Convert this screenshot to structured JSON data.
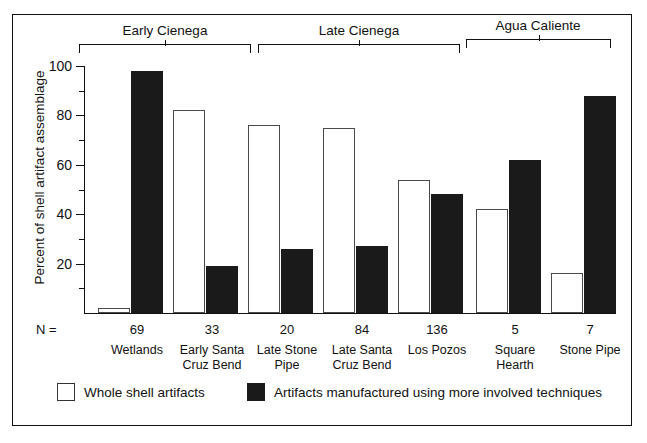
{
  "chart_data": {
    "type": "bar",
    "title": "",
    "xlabel": "",
    "ylabel": "Percent of shell artifact assemblage",
    "ylim": [
      0,
      100
    ],
    "yticks": [
      0,
      20,
      40,
      60,
      80,
      100
    ],
    "ytick_labels": [
      "",
      "20",
      "40",
      "60",
      "80",
      "100"
    ],
    "minor_ticks": [
      10,
      30,
      50,
      70,
      90
    ],
    "grid": false,
    "legend_position": "bottom",
    "categories": [
      "Wetlands",
      "Early Santa Cruz Bend",
      "Late Stone Pipe",
      "Late Santa Cruz Bend",
      "Los Pozos",
      "Square Hearth",
      "Stone Pipe"
    ],
    "n_values": [
      69,
      33,
      20,
      84,
      136,
      5,
      7
    ],
    "n_prefix": "N =",
    "series": [
      {
        "name": "Whole shell artifacts",
        "color": "#ffffff",
        "values": [
          2,
          82,
          76,
          75,
          54,
          42,
          16
        ]
      },
      {
        "name": "Artifacts manufactured using more  involved techniques",
        "color": "#1a1a1a",
        "values": [
          98,
          19,
          26,
          27,
          48,
          62,
          88
        ]
      }
    ],
    "groups": [
      {
        "label": "Early Cienega",
        "members": [
          "Wetlands",
          "Early Santa Cruz Bend"
        ]
      },
      {
        "label": "Late Cienega",
        "members": [
          "Late Stone Pipe",
          "Late Santa Cruz Bend",
          "Los Pozos"
        ]
      },
      {
        "label": "Agua Caliente",
        "members": [
          "Square Hearth",
          "Stone Pipe"
        ]
      }
    ]
  },
  "axis": {
    "ylabel": "Percent of shell artifact assemblage",
    "tick_100": "100",
    "tick_80": "80",
    "tick_60": "60",
    "tick_40": "40",
    "tick_20": "20",
    "n_prefix": "N ="
  },
  "groups": {
    "early_cienega": "Early Cienega",
    "late_cienega": "Late Cienega",
    "agua_caliente": "Agua Caliente"
  },
  "xlabels": [
    {
      "n": "69",
      "line1": "Wetlands",
      "line2": ""
    },
    {
      "n": "33",
      "line1": "Early Santa",
      "line2": "Cruz Bend"
    },
    {
      "n": "20",
      "line1": "Late Stone",
      "line2": "Pipe"
    },
    {
      "n": "84",
      "line1": "Late Santa",
      "line2": "Cruz Bend"
    },
    {
      "n": "136",
      "line1": "Los Pozos",
      "line2": ""
    },
    {
      "n": "5",
      "line1": "Square",
      "line2": "Hearth"
    },
    {
      "n": "7",
      "line1": "Stone Pipe",
      "line2": ""
    }
  ],
  "legend": {
    "whole": "Whole shell artifacts",
    "manufactured": "Artifacts manufactured using more  involved techniques"
  }
}
